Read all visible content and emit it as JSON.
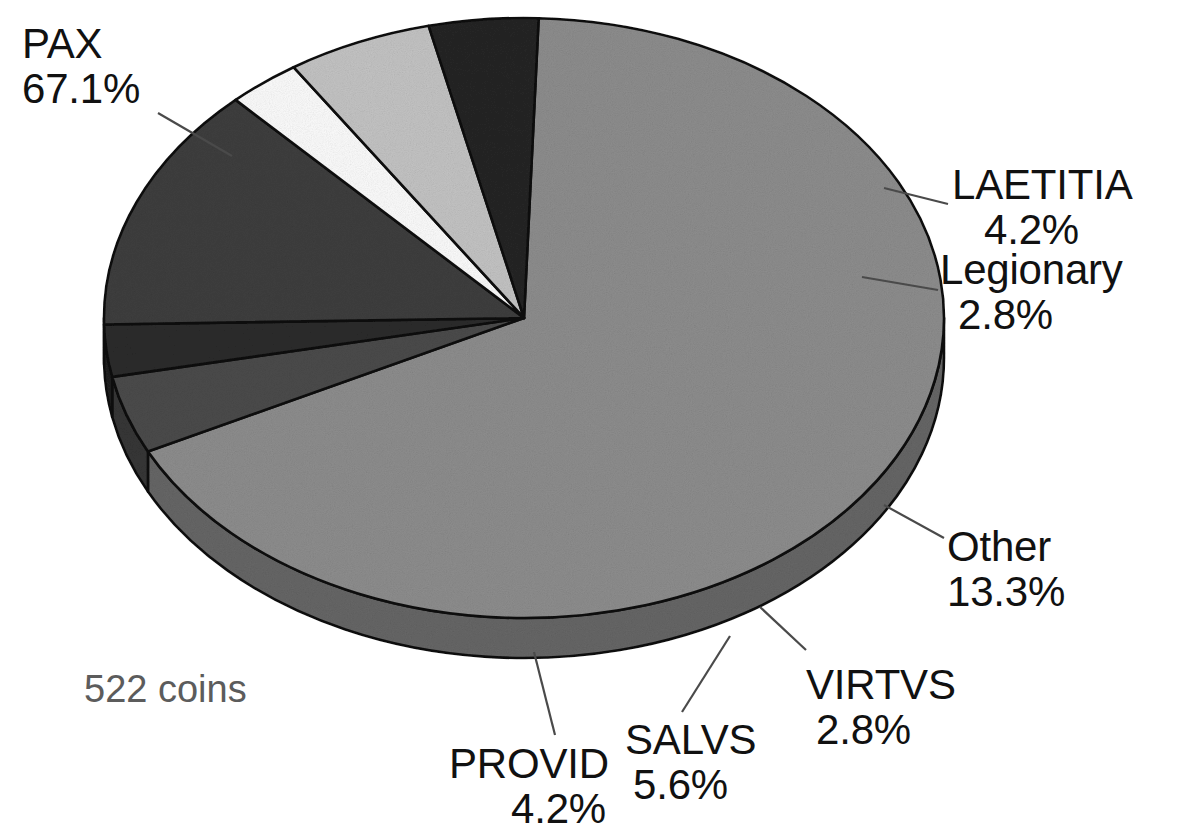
{
  "chart_data": {
    "type": "pie",
    "title": "",
    "subtitle": "",
    "xlabel": "",
    "ylabel": "",
    "legend_position": "none",
    "grid": false,
    "three_d": true,
    "total_label": "522 coins",
    "total_count": 522,
    "categories": [
      "PAX",
      "LAETITIA",
      "Legionary",
      "Other",
      "VIRTVS",
      "SALVS",
      "PROVID"
    ],
    "values": [
      67.1,
      4.2,
      2.8,
      13.3,
      2.8,
      5.6,
      4.2
    ],
    "value_unit": "%",
    "slices": [
      {
        "label": "PAX",
        "percent": "67.1%",
        "value": 67.1,
        "color": "#8d8d8d"
      },
      {
        "label": "LAETITIA",
        "percent": "4.2%",
        "value": 4.2,
        "color": "#4b4b4b"
      },
      {
        "label": "Legionary",
        "percent": "2.8%",
        "value": 2.8,
        "color": "#2c2c2c"
      },
      {
        "label": "Other",
        "percent": "13.3%",
        "value": 13.3,
        "color": "#3e3e3e"
      },
      {
        "label": "VIRTVS",
        "percent": "2.8%",
        "value": 2.8,
        "color": "#fbfbfb"
      },
      {
        "label": "SALVS",
        "percent": "5.6%",
        "value": 5.6,
        "color": "#c3c3c3"
      },
      {
        "label": "PROVID",
        "percent": "4.2%",
        "value": 4.2,
        "color": "#252525"
      }
    ]
  },
  "labels": {
    "pax": {
      "name": "PAX",
      "percent": "67.1%"
    },
    "laetitia": {
      "name": "LAETITIA",
      "percent": "4.2%"
    },
    "legionary": {
      "name": "Legionary",
      "percent": "2.8%"
    },
    "other": {
      "name": "Other",
      "percent": "13.3%"
    },
    "virtvs": {
      "name": "VIRTVS",
      "percent": "2.8%"
    },
    "salvs": {
      "name": "SALVS",
      "percent": "5.6%"
    },
    "provid": {
      "name": "PROVID",
      "percent": "4.2%"
    }
  },
  "caption": {
    "coins": "522 coins"
  },
  "colors": {
    "background": "#ffffff",
    "outline": "#101010",
    "text": "#111111",
    "caption_text": "#5c5c5c"
  }
}
